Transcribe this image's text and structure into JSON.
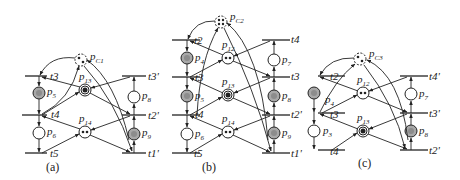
{
  "figure": {
    "colors": {
      "ink": "#222222",
      "gray_place": "#a8a8a8",
      "background": "#ffffff"
    },
    "panels": [
      {
        "caption": "(a)",
        "control_place": {
          "label": "p",
          "sub": "C1",
          "tokens": 2
        },
        "left_transitions": [
          "t3",
          "t4",
          "t5"
        ],
        "left_places": [
          {
            "label": "p",
            "sub": "5",
            "marked": true
          },
          {
            "label": "p",
            "sub": "6",
            "marked": false
          }
        ],
        "resource_places": [
          {
            "label": "p",
            "sub": "13",
            "tokens": 1
          },
          {
            "label": "p",
            "sub": "14",
            "tokens": 2
          }
        ],
        "right_transitions": [
          "t3'",
          "t2'",
          "t1'"
        ],
        "right_places": [
          {
            "label": "p",
            "sub": "8",
            "marked": false
          },
          {
            "label": "p",
            "sub": "9",
            "marked": true
          }
        ]
      },
      {
        "caption": "(b)",
        "control_place": {
          "label": "p",
          "sub": "C2",
          "tokens": 4
        },
        "left_transitions": [
          "t2",
          "t3",
          "t4",
          "t5"
        ],
        "left_side_labels": [
          "t3'",
          "t2'",
          "t1'"
        ],
        "left_places": [
          {
            "label": "p",
            "sub": "4",
            "marked": true
          },
          {
            "label": "p",
            "sub": "5",
            "marked": true
          },
          {
            "label": "p",
            "sub": "6",
            "marked": false
          }
        ],
        "resource_places": [
          {
            "label": "p",
            "sub": "12",
            "tokens": 2
          },
          {
            "label": "p",
            "sub": "13",
            "tokens": 1
          },
          {
            "label": "p",
            "sub": "14",
            "tokens": 2
          }
        ],
        "right_transitions": [
          "t4",
          "t3",
          "t2'",
          "t1'"
        ],
        "right_places": [
          {
            "label": "p",
            "sub": "7",
            "marked": false
          },
          {
            "label": "p",
            "sub": "8",
            "marked": true
          },
          {
            "label": "p",
            "sub": "9",
            "marked": true
          }
        ]
      },
      {
        "caption": "(c)",
        "control_place": {
          "label": "p",
          "sub": "C3",
          "tokens": 2
        },
        "left_transitions": [
          "t2",
          "t3",
          "t4"
        ],
        "left_side_labels": [
          "t4'",
          "t3'",
          "t2'",
          "t1'"
        ],
        "left_places": [
          {
            "label": "p",
            "sub": "4",
            "marked": true
          },
          {
            "label": "p",
            "sub": "3",
            "marked": false
          }
        ],
        "resource_places": [
          {
            "label": "p",
            "sub": "12",
            "tokens": 2
          },
          {
            "label": "p",
            "sub": "13",
            "tokens": 1
          }
        ],
        "right_transitions": [
          "t4'",
          "t3'",
          "t2'"
        ],
        "right_places": [
          {
            "label": "p",
            "sub": "7",
            "marked": false
          },
          {
            "label": "p",
            "sub": "8",
            "marked": true
          }
        ]
      }
    ]
  }
}
